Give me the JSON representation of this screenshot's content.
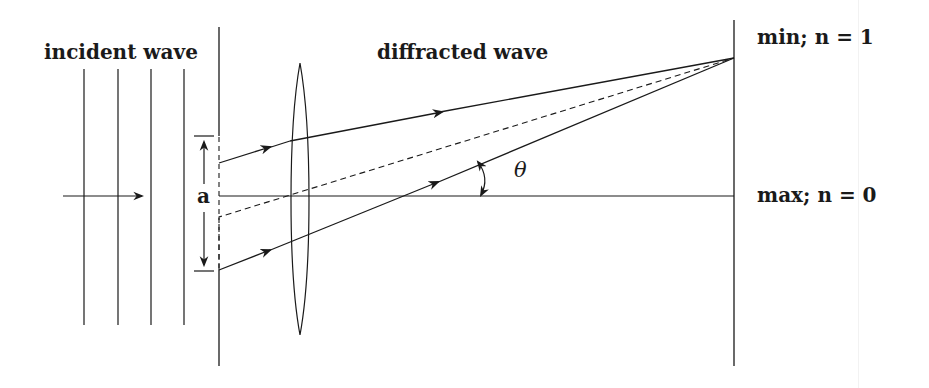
{
  "figure": {
    "labels": {
      "incident": "incident wave",
      "diffracted": "diffracted wave",
      "min": "min; n = 1",
      "max": "max; n = 0",
      "slit_width": "a",
      "angle": "θ"
    },
    "colors": {
      "ink": "#1a1a1a",
      "background": "#ffffff"
    }
  }
}
